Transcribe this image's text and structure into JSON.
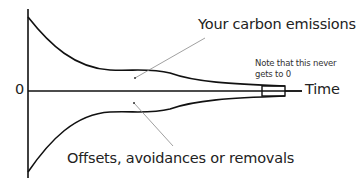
{
  "diagram": {
    "labels": {
      "emissions": "Your carbon emissions",
      "offsets": "Offsets, avoidances or removals",
      "note_line1": "Note that this never",
      "note_line2": "gets to 0",
      "x_axis": "Time",
      "zero": "0"
    },
    "colors": {
      "stroke": "#111111",
      "pointer": "#888888",
      "text": "#222222",
      "background": "#ffffff"
    }
  }
}
